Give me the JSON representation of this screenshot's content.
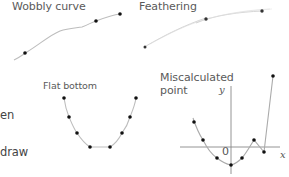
{
  "panels": {
    "wobbly": {
      "title": "Wobbly curve"
    },
    "feathering": {
      "title": "Feathering"
    },
    "flat_bottom": {
      "title": "Flat bottom"
    },
    "miscalculated": {
      "title_line1": "Miscalculated",
      "title_line2": "point",
      "x_label": "x",
      "y_label": "y",
      "origin_label": "0"
    }
  },
  "side_text": {
    "line1": "en",
    "line2": "draw"
  },
  "colors": {
    "curve": "#b8b8b8",
    "dot": "#111111",
    "axis": "#777777",
    "text": "#5a5a5a"
  }
}
